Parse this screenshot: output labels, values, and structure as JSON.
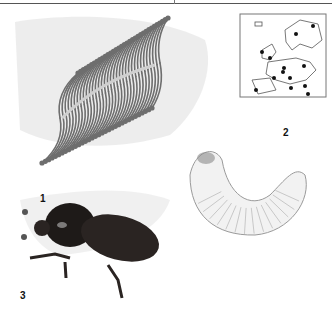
{
  "plate": {
    "figures": [
      {
        "number": "1",
        "subject": "bristled egg cluster on bark",
        "icon": "egg-cluster-illustration"
      },
      {
        "number": "2",
        "subject": "distribution map of Europe",
        "icon": "europe-map"
      },
      {
        "number": "3",
        "subject": "dark adult beetle on wood",
        "icon": "beetle-illustration"
      },
      {
        "subject": "curved white larva (grub)",
        "icon": "larva-illustration"
      }
    ]
  },
  "map": {
    "distribution_points": 13
  },
  "colors": {
    "beetle": "#1e1a18",
    "sketch": "#8a8a8a",
    "paper": "#ffffff"
  }
}
